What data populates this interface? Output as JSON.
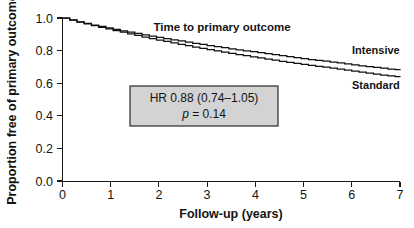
{
  "chart_data": {
    "type": "line",
    "subtype": "kaplan-meier-survival",
    "title": "Time to primary outcome",
    "xlabel": "Follow-up (years)",
    "ylabel": "Proportion free of primary outcome",
    "xlim": [
      0,
      7
    ],
    "ylim": [
      0.0,
      1.0
    ],
    "xticks": [
      0,
      1,
      2,
      3,
      4,
      5,
      6,
      7
    ],
    "xtick_labels": [
      "0",
      "1",
      "2",
      "3",
      "4",
      "5",
      "6",
      "7"
    ],
    "yticks": [
      0.0,
      0.2,
      0.4,
      0.6,
      0.8,
      1.0
    ],
    "ytick_labels": [
      "0.0",
      "0.2",
      "0.4",
      "0.6",
      "0.8",
      "1.0"
    ],
    "grid": false,
    "legend_position": "inline-right-of-curves",
    "series": [
      {
        "name": "Intensive",
        "label_x": 6.5,
        "label_y": 0.78,
        "x": [
          0.0,
          0.15,
          0.3,
          0.45,
          0.6,
          0.75,
          0.9,
          1.05,
          1.2,
          1.35,
          1.5,
          1.65,
          1.8,
          1.95,
          2.1,
          2.25,
          2.4,
          2.55,
          2.7,
          2.85,
          3.0,
          3.15,
          3.3,
          3.45,
          3.6,
          3.75,
          3.9,
          4.05,
          4.2,
          4.35,
          4.5,
          4.65,
          4.8,
          4.95,
          5.1,
          5.25,
          5.4,
          5.55,
          5.7,
          5.85,
          6.0,
          6.15,
          6.3,
          6.45,
          6.6,
          6.75,
          6.9,
          7.0
        ],
        "y": [
          1.0,
          0.988,
          0.977,
          0.967,
          0.957,
          0.948,
          0.939,
          0.93,
          0.921,
          0.913,
          0.905,
          0.897,
          0.889,
          0.881,
          0.873,
          0.866,
          0.859,
          0.852,
          0.845,
          0.838,
          0.831,
          0.824,
          0.818,
          0.811,
          0.805,
          0.799,
          0.793,
          0.787,
          0.781,
          0.775,
          0.769,
          0.763,
          0.757,
          0.751,
          0.745,
          0.74,
          0.735,
          0.73,
          0.724,
          0.718,
          0.712,
          0.707,
          0.702,
          0.697,
          0.692,
          0.687,
          0.683,
          0.68
        ]
      },
      {
        "name": "Standard",
        "label_x": 6.5,
        "label_y": 0.565,
        "x": [
          0.0,
          0.15,
          0.3,
          0.45,
          0.6,
          0.75,
          0.9,
          1.05,
          1.2,
          1.35,
          1.5,
          1.65,
          1.8,
          1.95,
          2.1,
          2.25,
          2.4,
          2.55,
          2.7,
          2.85,
          3.0,
          3.15,
          3.3,
          3.45,
          3.6,
          3.75,
          3.9,
          4.05,
          4.2,
          4.35,
          4.5,
          4.65,
          4.8,
          4.95,
          5.1,
          5.25,
          5.4,
          5.55,
          5.7,
          5.85,
          6.0,
          6.15,
          6.3,
          6.45,
          6.6,
          6.75,
          6.9,
          7.0
        ],
        "y": [
          1.0,
          0.987,
          0.975,
          0.964,
          0.953,
          0.943,
          0.933,
          0.923,
          0.913,
          0.903,
          0.893,
          0.883,
          0.874,
          0.865,
          0.856,
          0.847,
          0.838,
          0.83,
          0.822,
          0.814,
          0.806,
          0.798,
          0.79,
          0.783,
          0.776,
          0.769,
          0.762,
          0.755,
          0.748,
          0.741,
          0.734,
          0.728,
          0.722,
          0.716,
          0.71,
          0.704,
          0.698,
          0.692,
          0.686,
          0.68,
          0.674,
          0.668,
          0.662,
          0.656,
          0.65,
          0.645,
          0.641,
          0.638
        ]
      }
    ],
    "annotations": [
      {
        "id": "hr-box",
        "line1": "HR 0.88 (0.74–1.05)",
        "line2_italic": "p",
        "line2_rest": " = 0.14",
        "box_fill": "#d3d3d3",
        "box_stroke": "#2b2b2b"
      }
    ]
  },
  "colors": {
    "background": "#ffffff",
    "axis": "#1a1a1a",
    "curve": "#111111",
    "annotation_fill": "#d3d3d3",
    "annotation_border": "#2b2b2b"
  }
}
